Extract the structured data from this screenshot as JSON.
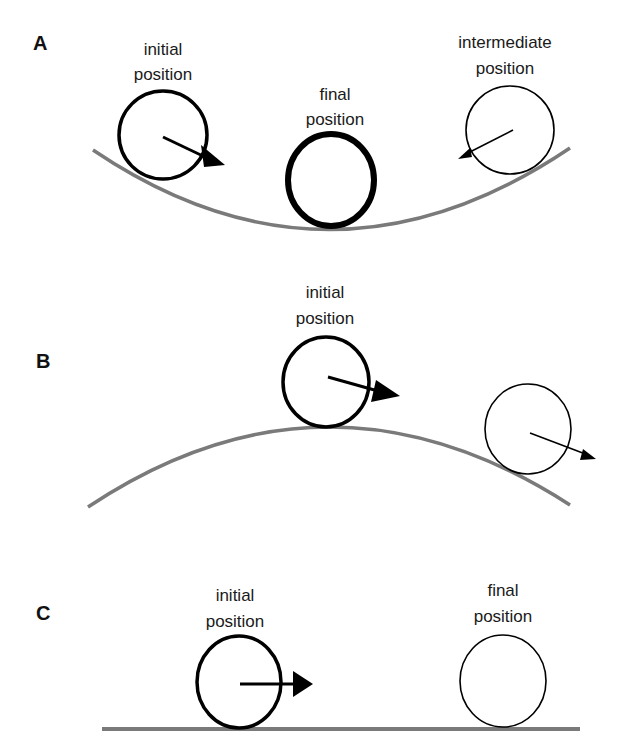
{
  "diagram": {
    "colors": {
      "surface": "#7a7a7a",
      "ball": "#000000",
      "background": "#ffffff"
    },
    "panels": [
      {
        "id": "A",
        "label": "A",
        "surface": "concave (valley)",
        "captions": {
          "initial_line1": "initial",
          "initial_line2": "position",
          "final_line1": "final",
          "final_line2": "position",
          "intermediate_line1": "intermediate",
          "intermediate_line2": "position"
        }
      },
      {
        "id": "B",
        "label": "B",
        "surface": "convex (hill)",
        "captions": {
          "initial_line1": "initial",
          "initial_line2": "position"
        }
      },
      {
        "id": "C",
        "label": "C",
        "surface": "flat",
        "captions": {
          "initial_line1": "initial",
          "initial_line2": "position",
          "final_line1": "final",
          "final_line2": "position"
        }
      }
    ]
  }
}
